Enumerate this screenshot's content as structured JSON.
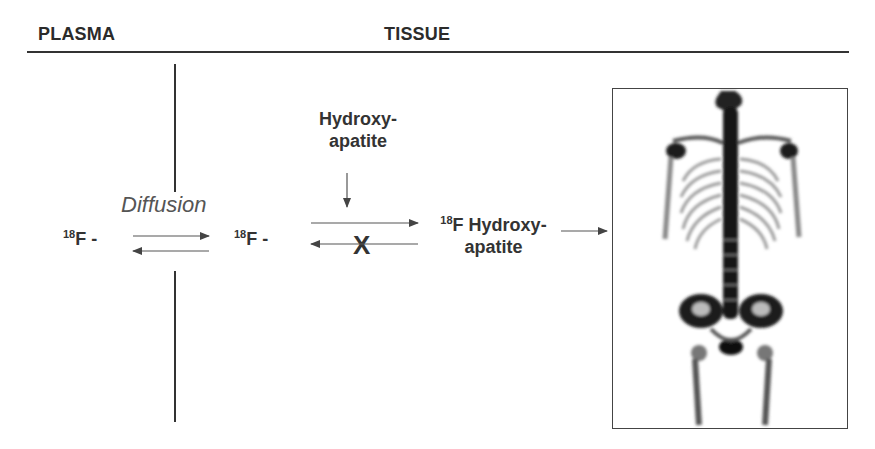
{
  "header": {
    "left_label": "PLASMA",
    "right_label": "TISSUE"
  },
  "diagram": {
    "plasma_species": {
      "isotope": "18",
      "element": "F -"
    },
    "process_label": "Diffusion",
    "tissue_species": {
      "isotope": "18",
      "element": "F -"
    },
    "reagent": {
      "line1": "Hydroxy-",
      "line2": "apatite"
    },
    "blocked_marker": "X",
    "product": {
      "isotope": "18",
      "line1": "F Hydroxy-",
      "line2": "apatite"
    },
    "image_caption": "",
    "image_description": "Whole-body bone scan (skeleton uptake)"
  },
  "colors": {
    "text": "#2b2b2b",
    "rule": "#333333",
    "arrow": "#444444",
    "italic": "#555555"
  }
}
